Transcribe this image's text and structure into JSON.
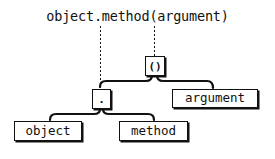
{
  "diagram": {
    "type": "syntax-tree",
    "expression": "object.method(argument)",
    "nodes": {
      "call": {
        "label": "()"
      },
      "access": {
        "label": "."
      },
      "argument": {
        "label": "argument"
      },
      "object": {
        "label": "object"
      },
      "method": {
        "label": "method"
      }
    },
    "edges": [
      {
        "from": "call",
        "to": "access"
      },
      {
        "from": "call",
        "to": "argument"
      },
      {
        "from": "access",
        "to": "object"
      },
      {
        "from": "access",
        "to": "method"
      }
    ],
    "leaders": [
      {
        "from_text": ".",
        "to": "access"
      },
      {
        "from_text": "(",
        "to": "call"
      }
    ],
    "colors": {
      "ink": "#111111",
      "background": "#ffffff"
    }
  }
}
